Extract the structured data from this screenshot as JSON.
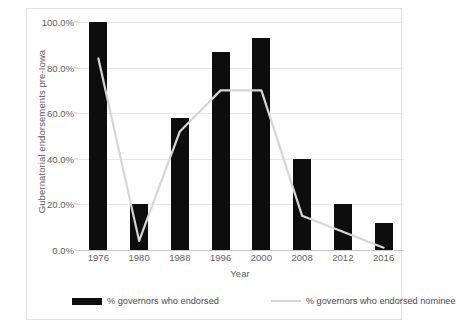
{
  "chart_data": {
    "type": "bar",
    "title": "",
    "xlabel": "Year",
    "ylabel": "Gubernatorial endorsements pre-Iowa",
    "categories": [
      "1976",
      "1980",
      "1988",
      "1996",
      "2000",
      "2008",
      "2012",
      "2016"
    ],
    "ylim": [
      0,
      100
    ],
    "yticks": [
      "0.0%",
      "20.0%",
      "40.0%",
      "60.0%",
      "80.0%",
      "100.0%"
    ],
    "ytick_values": [
      0,
      20,
      40,
      60,
      80,
      100
    ],
    "grid": true,
    "legend_position": "bottom",
    "series": [
      {
        "name": "% governors who endorsed",
        "type": "bar",
        "color": "#0d0d0d",
        "values": [
          100,
          20,
          58,
          87,
          93,
          40,
          20,
          12
        ]
      },
      {
        "name": "% governors who endorsed nominee",
        "type": "line",
        "color": "#d6d6d6",
        "values": [
          84,
          4,
          52,
          70,
          70,
          15,
          8,
          1
        ]
      }
    ]
  },
  "legend": {
    "bar_label": "% governors who endorsed",
    "line_label": "% governors who endorsed nominee"
  }
}
